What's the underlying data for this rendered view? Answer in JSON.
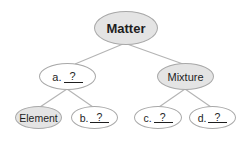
{
  "diagram": {
    "colors": {
      "filled_node": "#e4e4e4",
      "empty_node": "#ffffff",
      "border": "#a8a8a8",
      "edge": "#b4b4b4",
      "text": "#1e1e1e"
    },
    "nodes": {
      "root": {
        "label": "Matter"
      },
      "a": {
        "prefix": "a.",
        "blank": "?"
      },
      "mixture": {
        "label": "Mixture"
      },
      "element": {
        "label": "Element"
      },
      "b": {
        "prefix": "b.",
        "blank": "?"
      },
      "c": {
        "prefix": "c.",
        "blank": "?"
      },
      "d": {
        "prefix": "d.",
        "blank": "?"
      }
    },
    "edges": [
      [
        "Matter",
        "a"
      ],
      [
        "Matter",
        "Mixture"
      ],
      [
        "a",
        "Element"
      ],
      [
        "a",
        "b"
      ],
      [
        "Mixture",
        "c"
      ],
      [
        "Mixture",
        "d"
      ]
    ]
  }
}
